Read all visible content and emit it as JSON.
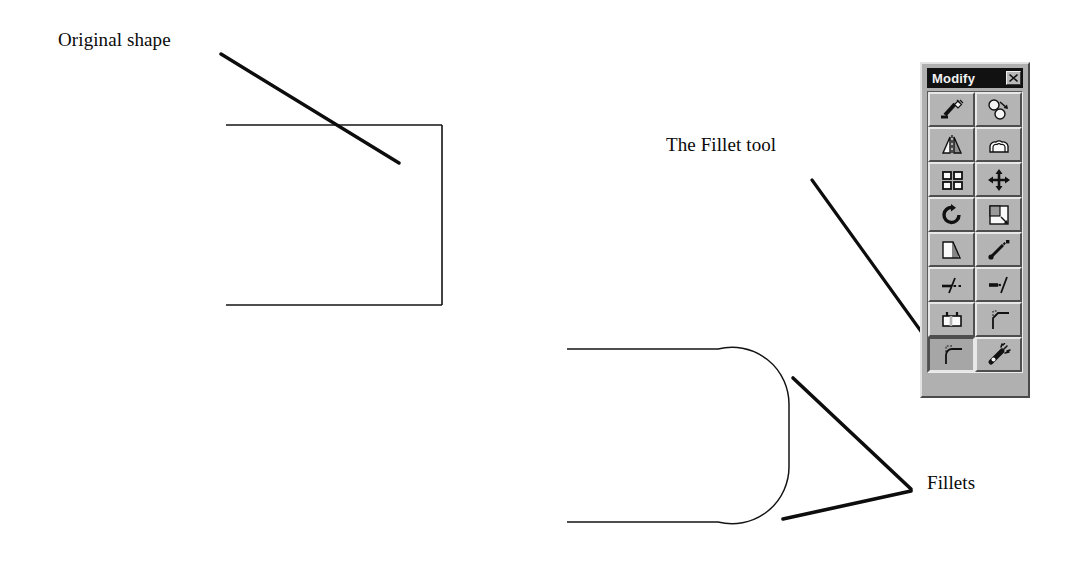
{
  "page": {
    "background_color": "#ffffff",
    "line_color": "#111111"
  },
  "annotations": {
    "original_shape": {
      "label": "Original shape",
      "leader": {
        "x1": 221,
        "y1": 54,
        "x2": 399,
        "y2": 163
      }
    },
    "fillet_tool": {
      "label": "The Fillet tool",
      "leader": {
        "x1": 812,
        "y1": 180,
        "x2": 946,
        "y2": 366
      }
    },
    "fillets": {
      "label": "Fillets",
      "leaders": [
        {
          "x1": 793,
          "y1": 378,
          "x2": 911,
          "y2": 489
        },
        {
          "x1": 783,
          "y1": 519,
          "x2": 911,
          "y2": 491
        }
      ]
    }
  },
  "drawings": {
    "original_shape": {
      "name": "open-rectangle",
      "description": "Open rectangle with square corners, left side missing",
      "top_line": {
        "x1": 226,
        "y1": 125,
        "x2": 442,
        "y2": 125
      },
      "right_line": {
        "x1": 442,
        "y1": 125,
        "x2": 442,
        "y2": 305
      },
      "bottom_line": {
        "x1": 226,
        "y1": 305,
        "x2": 442,
        "y2": 305
      }
    },
    "filleted_shape": {
      "name": "filleted-open-rectangle",
      "description": "Same open rectangle after applying fillets to the two right corners",
      "top_line": {
        "x1": 567,
        "y1": 349,
        "x2": 718,
        "y2": 349
      },
      "bottom_line": {
        "x1": 567,
        "y1": 522,
        "x2": 718,
        "y2": 522
      },
      "right_line": {
        "x1": 789,
        "y1": 405,
        "x2": 789,
        "y2": 466
      },
      "fillet_radius": 57
    }
  },
  "modify_toolbar": {
    "title": "Modify",
    "close_label": "Close",
    "close_icon": "close-icon",
    "colors": {
      "face": "#b0b0b0",
      "titlebar": "#111111",
      "titlebar_text": "#f2f2f2"
    },
    "buttons": [
      {
        "name": "erase",
        "label": "Erase",
        "icon": "erase-icon",
        "pressed": false
      },
      {
        "name": "copy",
        "label": "Copy",
        "icon": "copy-icon",
        "pressed": false
      },
      {
        "name": "mirror",
        "label": "Mirror",
        "icon": "mirror-icon",
        "pressed": false
      },
      {
        "name": "offset",
        "label": "Offset",
        "icon": "offset-icon",
        "pressed": false
      },
      {
        "name": "array",
        "label": "Array",
        "icon": "array-icon",
        "pressed": false
      },
      {
        "name": "move",
        "label": "Move",
        "icon": "move-icon",
        "pressed": false
      },
      {
        "name": "rotate",
        "label": "Rotate",
        "icon": "rotate-icon",
        "pressed": false
      },
      {
        "name": "scale",
        "label": "Scale",
        "icon": "scale-icon",
        "pressed": false
      },
      {
        "name": "stretch",
        "label": "Stretch",
        "icon": "stretch-icon",
        "pressed": false
      },
      {
        "name": "lengthen",
        "label": "Lengthen",
        "icon": "lengthen-icon",
        "pressed": false
      },
      {
        "name": "trim",
        "label": "Trim",
        "icon": "trim-icon",
        "pressed": false
      },
      {
        "name": "extend",
        "label": "Extend",
        "icon": "extend-icon",
        "pressed": false
      },
      {
        "name": "break",
        "label": "Break",
        "icon": "break-icon",
        "pressed": false
      },
      {
        "name": "chamfer",
        "label": "Chamfer",
        "icon": "chamfer-icon",
        "pressed": false
      },
      {
        "name": "fillet",
        "label": "Fillet",
        "icon": "fillet-icon",
        "pressed": true
      },
      {
        "name": "explode",
        "label": "Explode",
        "icon": "explode-icon",
        "pressed": false
      }
    ]
  }
}
